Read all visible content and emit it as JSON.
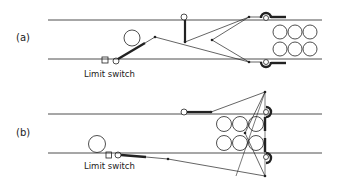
{
  "diagram": {
    "panels": [
      {
        "id": "a",
        "label": "(a)",
        "limit_switch_label": "Limit switch"
      },
      {
        "id": "b",
        "label": "(b)",
        "limit_switch_label": "Limit switch"
      }
    ],
    "colors": {
      "line": "#222222",
      "background": "#ffffff"
    }
  }
}
